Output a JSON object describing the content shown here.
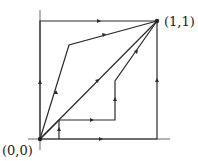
{
  "diagram": {
    "labels": {
      "origin": "(0,0)",
      "end": "(1,1)"
    },
    "points": {
      "origin": [
        40,
        139
      ],
      "end": [
        157,
        21
      ]
    },
    "paths": [
      {
        "name": "square-left-top",
        "points": [
          [
            40,
            139
          ],
          [
            40,
            21
          ],
          [
            157,
            21
          ]
        ]
      },
      {
        "name": "square-bottom-right",
        "points": [
          [
            40,
            139
          ],
          [
            157,
            139
          ],
          [
            157,
            21
          ]
        ]
      },
      {
        "name": "diagonal",
        "points": [
          [
            40,
            139
          ],
          [
            157,
            21
          ]
        ]
      },
      {
        "name": "upper-left-kinked",
        "points": [
          [
            40,
            139
          ],
          [
            69,
            45
          ],
          [
            157,
            21
          ]
        ]
      },
      {
        "name": "staircase",
        "points": [
          [
            40,
            139
          ],
          [
            59,
            120
          ],
          [
            115,
            120
          ],
          [
            115,
            81
          ],
          [
            157,
            21
          ]
        ]
      },
      {
        "name": "small-step",
        "points": [
          [
            59,
            139
          ],
          [
            59,
            120
          ]
        ]
      }
    ],
    "colors": {
      "line": "#2a2a2a",
      "axis": "#555555"
    }
  }
}
